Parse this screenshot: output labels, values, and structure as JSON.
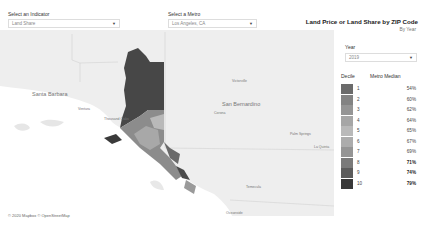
{
  "filters": {
    "indicator": {
      "label": "Select an Indicator",
      "value": "Land Share"
    },
    "metro": {
      "label": "Select a Metro",
      "value": "Los Angeles, CA"
    }
  },
  "header": {
    "title": "Land Price or Land Share by ZIP Code",
    "subtitle": "By Year"
  },
  "year": {
    "label": "Year",
    "value": "2019"
  },
  "legend": {
    "col_decile": "Decile",
    "col_median": "Metro Median",
    "rows": [
      {
        "decile": "1",
        "median": "54%",
        "color": "#6b6b6b"
      },
      {
        "decile": "2",
        "median": "60%",
        "color": "#838383"
      },
      {
        "decile": "3",
        "median": "62%",
        "color": "#959595"
      },
      {
        "decile": "4",
        "median": "64%",
        "color": "#a6a6a6"
      },
      {
        "decile": "5",
        "median": "65%",
        "color": "#b9b9b9"
      },
      {
        "decile": "6",
        "median": "67%",
        "color": "#acacac"
      },
      {
        "decile": "7",
        "median": "69%",
        "color": "#959595"
      },
      {
        "decile": "8",
        "median": "71%",
        "color": "#7a7a7a"
      },
      {
        "decile": "9",
        "median": "74%",
        "color": "#5c5c5c"
      },
      {
        "decile": "10",
        "median": "79%",
        "color": "#383838"
      }
    ]
  },
  "map": {
    "places": [
      {
        "name": "Santa Barbara"
      },
      {
        "name": "Ventura"
      },
      {
        "name": "Thousand Oaks"
      },
      {
        "name": "Victorville"
      },
      {
        "name": "San Bernardino"
      },
      {
        "name": "Corona"
      },
      {
        "name": "Palm Springs"
      },
      {
        "name": "La Quinta"
      },
      {
        "name": "Temecula"
      },
      {
        "name": "Oceanside"
      }
    ],
    "attribution": "© 2020 Mapbox © OpenStreetMap"
  }
}
